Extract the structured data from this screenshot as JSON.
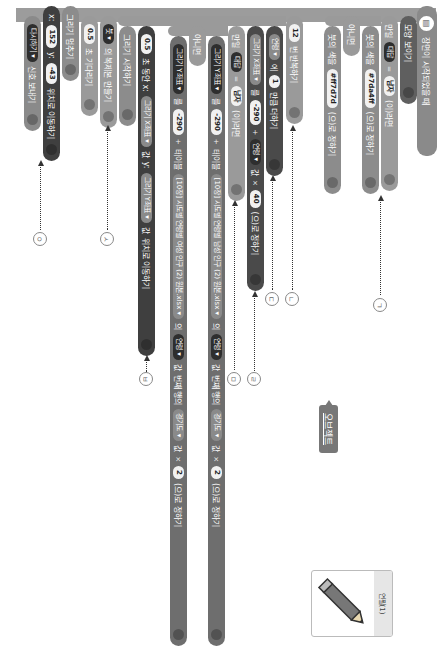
{
  "blocks": {
    "hat": "장면이 시작되었을 때",
    "show": "모양 보이기",
    "if1": {
      "kw": "만일",
      "var": "대답",
      "op": "=",
      "val": "남자",
      "tail": "(이)라면"
    },
    "brush1": {
      "pre": "붓의 색을",
      "val": "#7da4ff",
      "tail": "(으)로 정하기"
    },
    "else1": "아니면",
    "brush2": {
      "pre": "붓의 색을",
      "val": "#ff7d7d",
      "tail": "(으)로 정하기"
    },
    "repeat": {
      "val": "12",
      "tail": "번 반복하기"
    },
    "addvar": {
      "var": "연령 ▾",
      "mid": "에",
      "val": "1",
      "tail": "만큼 더하기"
    },
    "setx": {
      "var": "그리기 X좌표 ▾",
      "mid": "를",
      "v1": "-290",
      "op1": "+",
      "v2": "연령 ▾",
      "v2b": "값",
      "op2": "×",
      "v3": "40",
      "tail": "(으)로 정하기"
    },
    "if2": {
      "kw": "만일",
      "var": "대답",
      "op": "=",
      "val": "남자",
      "tail": "(이)라면"
    },
    "sety1": {
      "var": "그리기 Y좌표 ▾",
      "mid": "를",
      "v1": "-290",
      "op1": "+",
      "t1": "테이블",
      "t2": "[10장] 시도별 연령별 남성 인구 (2) 원본.xlsx ▾",
      "t3": "의",
      "row": "연령 ▾",
      "rowb": "값",
      "t4": "번째 행의",
      "col": "경기도 ▾",
      "colb": "값",
      "op2": "×",
      "v3": "2",
      "tail": "(으)로 정하기"
    },
    "else2": "아니면",
    "sety2": {
      "var": "그리기 Y좌표 ▾",
      "mid": "를",
      "v1": "-290",
      "op1": "+",
      "t1": "테이블",
      "t2": "[10장] 시도별 연령별 여성 인구 (2) 원본.xlsx ▾",
      "t3": "의",
      "row": "연령 ▾",
      "rowb": "값",
      "t4": "번째 행의",
      "col": "경기도 ▾",
      "colb": "값",
      "op2": "×",
      "v3": "2",
      "tail": "(으)로 정하기"
    },
    "glide": {
      "v1": "0.5",
      "t1": "초 동안 x:",
      "x": "그리기 X좌표 ▾",
      "xb": "값",
      "t2": "y:",
      "y": "그리기 Y좌표 ▾",
      "yb": "값",
      "tail": "위치로 이동하기"
    },
    "startdraw": "그리기 시작하기",
    "clone": {
      "val": "붓 ▾",
      "tail": "의 복제본 만들기"
    },
    "wait": {
      "val": "0.5",
      "tail": "초 기다리기"
    },
    "stopdraw": "그리기 멈추기",
    "moveto": {
      "t1": "x:",
      "x": "152",
      "t2": "y:",
      "y": "-43",
      "tail": "위치로 이동하기"
    },
    "signal": {
      "val": "다시하기 ▾",
      "tail": "신호 보내기"
    }
  },
  "labels": [
    "ㄱ",
    "ㄴ",
    "ㄷ",
    "ㄹ",
    "ㅁ",
    "ㅂ",
    "ㅅ",
    "ㅇ"
  ],
  "object_panel": {
    "tooltip": "오브젝트",
    "name": "연필(1)",
    "icon": "pencil-icon"
  }
}
